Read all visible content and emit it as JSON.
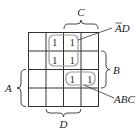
{
  "diagram": {
    "type": "karnaugh-map",
    "rows": 4,
    "cols": 4,
    "cells": [
      [
        "",
        "1",
        "1",
        ""
      ],
      [
        "",
        "1",
        "1",
        ""
      ],
      [
        "",
        "",
        "1",
        "1"
      ],
      [
        "",
        "",
        "",
        ""
      ]
    ],
    "variable_labels": {
      "top": "C",
      "right": "B",
      "left": "A",
      "bottom": "D"
    },
    "groups": [
      {
        "label_main": "AD",
        "label_bar": "A",
        "description": "A-bar D",
        "cells": "rows 1-2, cols 2-3"
      },
      {
        "label_main": "ABC",
        "description": "ABC",
        "cells": "row 3, cols 3-4"
      }
    ],
    "colors": {
      "grid": "#333333",
      "loop": "#999999",
      "text": "#222222"
    }
  }
}
